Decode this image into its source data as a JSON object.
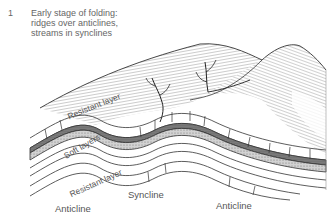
{
  "caption": {
    "number": "1",
    "lines": [
      "Early stage of folding:",
      "ridges over anticlines,",
      "streams in synclines"
    ]
  },
  "layer_labels": {
    "resistant_top": "Resistant layer",
    "soft": "Soft layers",
    "resistant_bottom": "Resistant layer"
  },
  "structure_labels": {
    "anticline_left": "Anticline",
    "syncline": "Syncline",
    "anticline_right": "Anticline"
  },
  "colors": {
    "line": "#333333",
    "dark_band": "#6e6e6e",
    "stipple_band": "#bdbdbd",
    "text": "#555555"
  }
}
